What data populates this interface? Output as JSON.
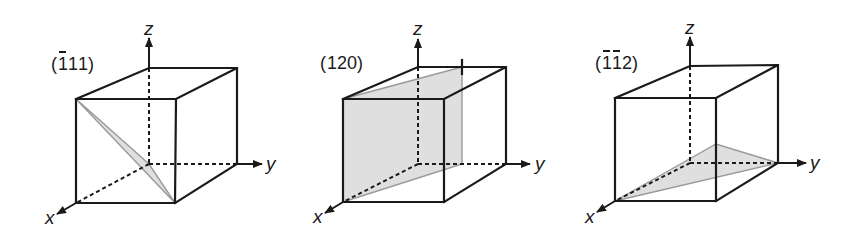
{
  "figure": {
    "colors": {
      "edge": "#1a1a1a",
      "plane_fill": "#d9d9d9",
      "plane_stroke": "#9a9a9a"
    },
    "panels": [
      {
        "label": "(111)",
        "label_display": "(1̄11)",
        "overbars": [
          0
        ],
        "digits": [
          "1",
          "1",
          "1"
        ],
        "axes": {
          "x": "x",
          "y": "y",
          "z": "z"
        }
      },
      {
        "label": "(120)",
        "label_display": "(120)",
        "overbars": [],
        "digits": [
          "1",
          "2",
          "0"
        ],
        "axes": {
          "x": "x",
          "y": "y",
          "z": "z"
        }
      },
      {
        "label": "(112)",
        "label_display": "(1̄1̄2)",
        "overbars": [
          0,
          1
        ],
        "digits": [
          "1",
          "1",
          "2"
        ],
        "axes": {
          "x": "x",
          "y": "y",
          "z": "z"
        }
      }
    ]
  }
}
